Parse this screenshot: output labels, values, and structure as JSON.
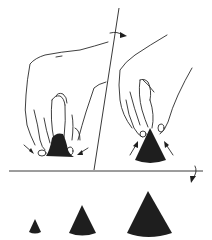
{
  "figure": {
    "colors": {
      "background": "#ffffff",
      "ink": "#2a2a2a",
      "fill": "#1e1e1e"
    },
    "panels": [
      {
        "id": "step-1",
        "label": "",
        "content": "hand pressing lump from above, arrows pointing inward at base"
      },
      {
        "id": "step-2",
        "label": "",
        "content": "hand pinching cone tip, arrows pointing inward at sides"
      }
    ],
    "arrows": [
      {
        "id": "rotate-arrow-top",
        "direction": "right"
      },
      {
        "id": "rotate-arrow-right",
        "direction": "down"
      }
    ],
    "cones": [
      {
        "size": "small",
        "cx": 35,
        "base_y": 233,
        "height": 14,
        "half_width": 6
      },
      {
        "size": "medium",
        "cx": 82,
        "base_y": 235,
        "height": 30,
        "half_width": 14
      },
      {
        "size": "large",
        "cx": 148,
        "base_y": 237,
        "height": 45,
        "half_width": 24
      }
    ]
  }
}
